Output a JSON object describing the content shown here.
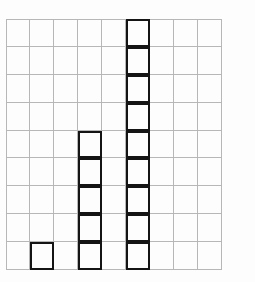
{
  "figure": {
    "title": "",
    "background_color": "#fdfdfd",
    "grid_line_color": "#b7b7b7",
    "block_outline_color": "#141414"
  },
  "chart_data": {
    "type": "bar",
    "title": "",
    "subtitle": "",
    "xlabel": "",
    "ylabel": "",
    "grid": true,
    "grid_columns": 9,
    "grid_rows": 9,
    "legend": null,
    "legend_position": "none",
    "annotations": [],
    "unit": "block",
    "note": "Bottom-aligned stacks of unit squares drawn on a 9 x 9 square grid; bars occupy grid columns 2, 4 and 6 (1-indexed), remaining columns are empty.",
    "categories": [
      "1",
      "2",
      "3",
      "4",
      "5",
      "6",
      "7",
      "8",
      "9"
    ],
    "values": [
      0,
      1,
      0,
      5,
      0,
      9,
      0,
      0,
      0
    ],
    "xlim": [
      0,
      9
    ],
    "ylim": [
      0,
      9
    ],
    "xticklabels": [],
    "yticklabels": [],
    "bars": [
      {
        "column": 2,
        "blocks": 1
      },
      {
        "column": 4,
        "blocks": 5
      },
      {
        "column": 6,
        "blocks": 9
      }
    ]
  }
}
